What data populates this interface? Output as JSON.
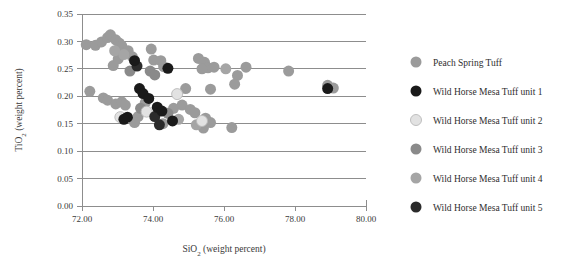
{
  "chart_data": {
    "type": "scatter",
    "title": "",
    "xlabel": "SiO2 (weight percent)",
    "xlabel_parts": {
      "pre": "SiO",
      "sub": "2",
      "post": " (weight percent)"
    },
    "ylabel": "TiO2 (weight percent)",
    "ylabel_parts": {
      "pre": "TiO",
      "sub": "2",
      "post": " (weight percent)"
    },
    "xlim": [
      72.0,
      80.0
    ],
    "ylim": [
      0.0,
      0.35
    ],
    "xticks": [
      "72.00",
      "74.00",
      "76.00",
      "78.00",
      "80.00"
    ],
    "xtick_values": [
      72.0,
      74.0,
      76.0,
      78.0,
      80.0
    ],
    "yticks": [
      "0.00",
      "0.05",
      "0.10",
      "0.15",
      "0.20",
      "0.25",
      "0.30",
      "0.35"
    ],
    "ytick_values": [
      0.0,
      0.05,
      0.1,
      0.15,
      0.2,
      0.25,
      0.3,
      0.35
    ],
    "grid": true,
    "grid_axis": "y",
    "legend_position": "right",
    "marker": "circle",
    "marker_size_px": 11,
    "series": [
      {
        "name": "Peach Spring Tuff",
        "color": "#9b9b9b",
        "outline": false,
        "points": [
          [
            72.12,
            0.294
          ],
          [
            72.38,
            0.293
          ],
          [
            72.55,
            0.299
          ],
          [
            72.72,
            0.307
          ],
          [
            72.8,
            0.312
          ],
          [
            72.95,
            0.303
          ],
          [
            73.05,
            0.297
          ],
          [
            73.12,
            0.292
          ],
          [
            73.02,
            0.268
          ],
          [
            72.88,
            0.256
          ],
          [
            73.3,
            0.283
          ],
          [
            73.42,
            0.272
          ],
          [
            73.95,
            0.286
          ],
          [
            74.02,
            0.266
          ],
          [
            74.22,
            0.265
          ],
          [
            74.3,
            0.254
          ],
          [
            75.28,
            0.269
          ],
          [
            75.45,
            0.262
          ],
          [
            75.55,
            0.252
          ],
          [
            75.72,
            0.253
          ],
          [
            75.38,
            0.25
          ],
          [
            76.62,
            0.253
          ],
          [
            77.82,
            0.246
          ],
          [
            78.92,
            0.22
          ],
          [
            79.08,
            0.215
          ],
          [
            76.38,
            0.238
          ],
          [
            76.3,
            0.222
          ],
          [
            72.22,
            0.209
          ],
          [
            72.6,
            0.197
          ],
          [
            72.72,
            0.193
          ],
          [
            72.95,
            0.186
          ],
          [
            73.12,
            0.19
          ],
          [
            73.22,
            0.184
          ],
          [
            73.78,
            0.188
          ],
          [
            74.58,
            0.178
          ],
          [
            74.82,
            0.184
          ],
          [
            75.05,
            0.176
          ],
          [
            75.18,
            0.17
          ],
          [
            73.58,
            0.163
          ],
          [
            73.48,
            0.152
          ],
          [
            74.28,
            0.15
          ],
          [
            75.48,
            0.16
          ],
          [
            75.62,
            0.152
          ],
          [
            75.42,
            0.142
          ],
          [
            76.22,
            0.143
          ],
          [
            74.92,
            0.214
          ],
          [
            75.62,
            0.213
          ]
        ]
      },
      {
        "name": "Wild Horse Mesa Tuff unit 1",
        "color": "#1a1a1a",
        "outline": false,
        "points": [
          [
            73.48,
            0.265
          ],
          [
            74.42,
            0.251
          ],
          [
            73.62,
            0.214
          ],
          [
            73.72,
            0.205
          ],
          [
            73.88,
            0.196
          ],
          [
            74.12,
            0.18
          ],
          [
            74.25,
            0.173
          ],
          [
            73.28,
            0.162
          ],
          [
            74.55,
            0.155
          ],
          [
            73.18,
            0.158
          ],
          [
            78.92,
            0.214
          ]
        ]
      },
      {
        "name": "Wild Horse Mesa Tuff unit 2",
        "color": "#e2e2e2",
        "outline": true,
        "points": [
          [
            74.68,
            0.204
          ],
          [
            73.08,
            0.162
          ],
          [
            73.82,
            0.172
          ],
          [
            75.38,
            0.155
          ]
        ]
      },
      {
        "name": "Wild Horse Mesa Tuff unit 3",
        "color": "#8a8a8a",
        "outline": false,
        "points": [
          [
            73.92,
            0.246
          ],
          [
            74.05,
            0.239
          ],
          [
            73.35,
            0.246
          ],
          [
            74.42,
            0.169
          ],
          [
            73.65,
            0.178
          ]
        ]
      },
      {
        "name": "Wild Horse Mesa Tuff unit 4",
        "color": "#a5a5a5",
        "outline": false,
        "points": [
          [
            72.92,
            0.283
          ],
          [
            73.18,
            0.276
          ],
          [
            76.05,
            0.25
          ],
          [
            74.72,
            0.158
          ],
          [
            75.22,
            0.148
          ]
        ]
      },
      {
        "name": "Wild Horse Mesa Tuff unit 5",
        "color": "#2b2b2b",
        "outline": false,
        "points": [
          [
            73.55,
            0.255
          ],
          [
            74.18,
            0.148
          ],
          [
            74.05,
            0.163
          ]
        ]
      }
    ]
  },
  "legend": {
    "items": [
      {
        "label": "Peach Spring Tuff",
        "color": "#9b9b9b",
        "outline": false
      },
      {
        "label": "Wild Horse Mesa Tuff unit 1",
        "color": "#1a1a1a",
        "outline": false
      },
      {
        "label": "Wild Horse Mesa Tuff unit 2",
        "color": "#e2e2e2",
        "outline": true
      },
      {
        "label": "Wild Horse Mesa Tuff unit 3",
        "color": "#8a8a8a",
        "outline": false
      },
      {
        "label": "Wild Horse Mesa Tuff unit 4",
        "color": "#a5a5a5",
        "outline": false
      },
      {
        "label": "Wild Horse Mesa Tuff unit 5",
        "color": "#2b2b2b",
        "outline": false
      }
    ]
  },
  "style": {
    "grid_color": "#8d8d8d",
    "axis_color": "#8d8d8d",
    "text_color": "#3a3a3a",
    "background": "#ffffff"
  }
}
